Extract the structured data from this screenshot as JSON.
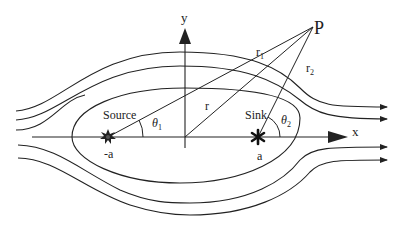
{
  "diagram": {
    "labels": {
      "y_axis": "y",
      "x_axis": "x",
      "point": "P",
      "r1": "r",
      "r1_sub": "1",
      "r2": "r",
      "r2_sub": "2",
      "r": "r",
      "source": "Source",
      "sink": "Sink",
      "theta1": "θ",
      "theta1_sub": "1",
      "theta2": "θ",
      "theta2_sub": "2",
      "source_pos": "-a",
      "sink_pos": "a"
    },
    "colors": {
      "line": "#222222",
      "background": "#ffffff"
    }
  }
}
